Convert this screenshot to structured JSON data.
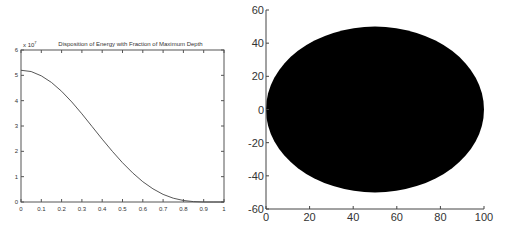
{
  "chart_data": [
    {
      "type": "line",
      "title": "Disposition of Energy with Fraction of Maximum Depth",
      "xlabel": "",
      "ylabel": "",
      "y_multiplier_label": "x 10^7",
      "xlim": [
        0,
        1
      ],
      "ylim": [
        0,
        6
      ],
      "grid": false,
      "x_ticks": [
        "0",
        "0.1",
        "0.2",
        "0.3",
        "0.4",
        "0.5",
        "0.6",
        "0.7",
        "0.8",
        "0.9",
        "1"
      ],
      "y_ticks": [
        "0",
        "1",
        "2",
        "3",
        "4",
        "5",
        "6"
      ],
      "x": [
        0,
        0.05,
        0.1,
        0.15,
        0.2,
        0.25,
        0.3,
        0.35,
        0.4,
        0.45,
        0.5,
        0.55,
        0.6,
        0.65,
        0.7,
        0.75,
        0.8,
        0.85,
        0.9,
        0.95,
        1.0
      ],
      "series": [
        {
          "name": "energy",
          "values": [
            5.2,
            5.15,
            4.98,
            4.72,
            4.37,
            3.95,
            3.48,
            2.98,
            2.48,
            2.0,
            1.55,
            1.15,
            0.8,
            0.52,
            0.3,
            0.15,
            0.06,
            0.015,
            0.0,
            0.0,
            0.0
          ]
        }
      ]
    },
    {
      "type": "scatter",
      "title": "",
      "xlabel": "",
      "ylabel": "",
      "xlim": [
        0,
        100
      ],
      "ylim": [
        -60,
        60
      ],
      "grid": false,
      "x_ticks": [
        "0",
        "20",
        "40",
        "60",
        "80",
        "100"
      ],
      "y_ticks": [
        "-60",
        "-40",
        "-20",
        "0",
        "20",
        "40",
        "60"
      ],
      "shape": "filled ellipse",
      "center": [
        50,
        0
      ],
      "x_range": [
        0,
        100
      ],
      "y_range": [
        -50,
        50
      ],
      "fill_color": "#000000"
    }
  ]
}
